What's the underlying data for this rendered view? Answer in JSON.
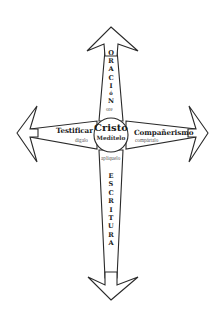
{
  "center": {
    "title": "Cristo",
    "subtitle": "Medítelo"
  },
  "arms": {
    "top": {
      "word_letters": [
        "O",
        "R",
        "A",
        "C",
        "I",
        "ó",
        "N"
      ],
      "word": "ORACIóN",
      "sublabel": "ore"
    },
    "bottom": {
      "word_letters": [
        "E",
        "S",
        "C",
        "R",
        "I",
        "T",
        "U",
        "R",
        "A"
      ],
      "word": "ESCRITURA",
      "sublabel": "aplíquelo"
    },
    "left": {
      "label": "Testificar",
      "sublabel": "dígalo"
    },
    "right": {
      "label": "Compañerismo",
      "sublabel": "compártalo"
    }
  },
  "colors": {
    "stroke": "#2a2a2a",
    "fill": "#ffffff",
    "text": "#222222",
    "subtext": "#555555"
  }
}
